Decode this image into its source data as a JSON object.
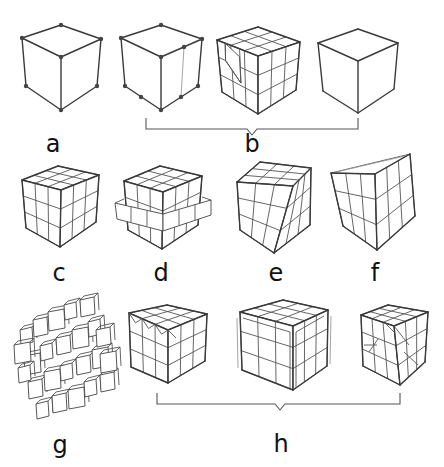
{
  "figure": {
    "background": "#ffffff",
    "line_color": "#3a3a3a",
    "panels": [
      {
        "id": "a",
        "label": "a",
        "label_pos": [
          53,
          152
        ],
        "description": "cube wireframe with 8 vertex points"
      },
      {
        "id": "b1",
        "group": "b",
        "description": "cube wireframe with extra vertices and inserted edge"
      },
      {
        "id": "b2",
        "group": "b",
        "description": "3x3 subdivided cube with diagonal cut on left face"
      },
      {
        "id": "b3",
        "group": "b",
        "description": "plain cube outline"
      },
      {
        "id": "c",
        "label": "c",
        "label_pos": [
          59,
          281
        ],
        "description": "3x3x3 grid cube"
      },
      {
        "id": "d",
        "label": "d",
        "label_pos": [
          161,
          281
        ],
        "description": "cube with protruding middle layer"
      },
      {
        "id": "e",
        "label": "e",
        "label_pos": [
          276,
          281
        ],
        "description": "twisted / deformed grid cube"
      },
      {
        "id": "f",
        "label": "f",
        "label_pos": [
          375,
          281
        ],
        "description": "tapered grid cube"
      },
      {
        "id": "g",
        "label": "g",
        "label_pos": [
          60,
          453
        ],
        "description": "exploded cubelets"
      },
      {
        "id": "h1",
        "group": "h",
        "description": "grid cube with triangular top edge cuts"
      },
      {
        "id": "h2",
        "group": "h",
        "description": "bevelled grid cube"
      },
      {
        "id": "h3",
        "group": "h",
        "description": "grid cube with chamfered corner and diagonal edges"
      }
    ],
    "groups": [
      {
        "id": "b",
        "label": "b",
        "label_pos": [
          252,
          152
        ],
        "bracket": {
          "x1": 146,
          "x2": 358,
          "y_top": 118,
          "y": 129,
          "notch_x": 252,
          "notch_depth": 6
        }
      },
      {
        "id": "h",
        "label": "h",
        "label_pos": [
          281,
          452
        ],
        "bracket": {
          "x1": 157,
          "x2": 400,
          "y_top": 393,
          "y": 404,
          "notch_x": 280,
          "notch_depth": 6
        }
      }
    ]
  }
}
